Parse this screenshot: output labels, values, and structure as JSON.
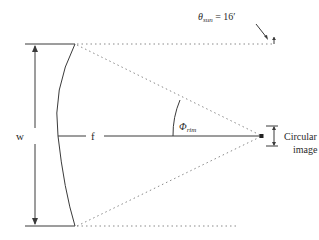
{
  "diagram": {
    "labels": {
      "theta": "θ",
      "theta_sub": "sun",
      "theta_value": " = 16′",
      "width": "w",
      "focal": "f",
      "rim_angle": "Φ",
      "rim_angle_sub": "rim",
      "sun_image_line1": "Circular sun",
      "sun_image_line2": "image"
    },
    "colors": {
      "line": "#3a3a3a",
      "dotted": "#8a8a8a",
      "background": "#ffffff"
    }
  }
}
